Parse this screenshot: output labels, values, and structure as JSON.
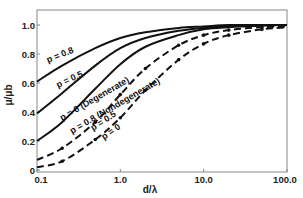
{
  "chart_data": {
    "type": "line",
    "title": "",
    "xlabel": "d/λ",
    "ylabel": "μ/μb",
    "xscale": "log",
    "xlim": [
      0.1,
      100.0
    ],
    "ylim": [
      0,
      1.1
    ],
    "grid": false,
    "legend": "none (inline curve labels)",
    "x_ticks": [
      "0.1",
      "1.0",
      "10.0",
      "100.0"
    ],
    "y_ticks": [
      "0",
      "0.2",
      "0.4",
      "0.6",
      "0.8",
      "1.0"
    ],
    "x": [
      0.1,
      0.2,
      0.5,
      1.0,
      2.0,
      5.0,
      10.0,
      20.0,
      50.0,
      100.0
    ],
    "series": [
      {
        "name": "p = 0.8",
        "style": "solid",
        "values": [
          0.61,
          0.72,
          0.84,
          0.91,
          0.95,
          0.98,
          0.99,
          1.0,
          1.0,
          1.0
        ]
      },
      {
        "name": "p = 0.5",
        "style": "solid",
        "values": [
          0.39,
          0.53,
          0.72,
          0.84,
          0.91,
          0.96,
          0.98,
          0.99,
          1.0,
          1.0
        ]
      },
      {
        "name": "p = 0 (Degenerate)",
        "style": "solid",
        "values": [
          0.2,
          0.33,
          0.56,
          0.73,
          0.85,
          0.93,
          0.97,
          0.985,
          0.995,
          1.0
        ]
      },
      {
        "name": "p = 0.8 (Nondegenerate)",
        "style": "dashed",
        "markers": true,
        "values": [
          0.07,
          0.15,
          0.33,
          0.52,
          0.7,
          0.86,
          0.93,
          0.965,
          0.985,
          0.99
        ]
      },
      {
        "name": "p = 0.5",
        "style": "dashed",
        "markers": true,
        "values": [
          0.02,
          0.06,
          0.21,
          0.36,
          0.55,
          0.76,
          0.87,
          0.93,
          0.97,
          0.985
        ]
      }
    ],
    "curve_labels": [
      "p = 0.8",
      "p = 0.5",
      "p = 0 (Degenerate)",
      "p = 0.8 (Nondegenerate)",
      "p = 0.5",
      "p = 0"
    ]
  }
}
